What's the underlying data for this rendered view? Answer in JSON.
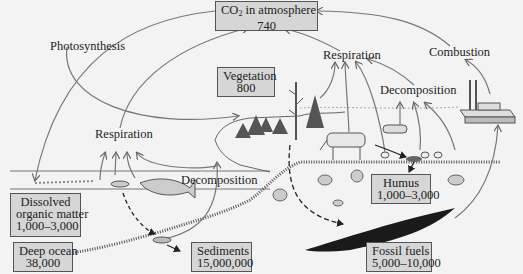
{
  "diagram": {
    "background_color": "#f3f3f3",
    "box_fill": "#d6d6d6",
    "arrow_color": "#777777",
    "reservoirs": [
      {
        "id": "atmosphere",
        "name_prefix": "CO",
        "name_sub": "2",
        "name_suffix": " in atmosphere",
        "value": "740"
      },
      {
        "id": "vegetation",
        "name": "Vegetation",
        "value": "800"
      },
      {
        "id": "dissolved",
        "name_line1": "Dissolved",
        "name_line2": "organic matter",
        "value": "1,000–3,000"
      },
      {
        "id": "deep_ocean",
        "name": "Deep ocean",
        "value": "38,000"
      },
      {
        "id": "sediments",
        "name": "Sediments",
        "value": "15,000,000"
      },
      {
        "id": "humus",
        "name": "Humus",
        "value": "1,000–3,000"
      },
      {
        "id": "fossil_fuels",
        "name": "Fossil fuels",
        "value": "5,000–10,000"
      }
    ],
    "processes": {
      "photosynthesis": "Photosynthesis",
      "respiration_land": "Respiration",
      "respiration_ocean": "Respiration",
      "combustion": "Combustion",
      "decomposition_land": "Decomposition",
      "decomposition_ocean": "Decomposition"
    }
  }
}
